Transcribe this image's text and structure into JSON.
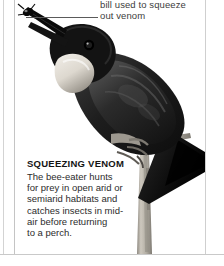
{
  "page": {
    "background_color": "#ffffff",
    "rule_color": "#c9c9c9"
  },
  "annotation": {
    "name": "bill-callout",
    "lines": [
      "bill used to squeeze",
      "out venom"
    ],
    "text": "bill used to squeeze out venom",
    "leader_line_color": "#5a5a5a"
  },
  "caption": {
    "title": "SQUEEZING VENOM",
    "lines": [
      "The bee-eater hunts",
      "for prey in open arid or",
      "semiarid habitats and",
      "catches insects in mid-",
      "air before returning",
      "to a perch."
    ],
    "text": "The bee-eater hunts for prey in open arid or semiarid habitats and catches insects in mid-air before returning to a perch."
  },
  "artwork": {
    "subject": "bee-eater bird perched on branch holding insect in bill",
    "alt": "Photograph of a dark bee-eater with pale throat patch gripping a vertical branch, an insect held in its open bill",
    "colors": {
      "plumage_dark": "#1b1b1b",
      "plumage_mid": "#4a4a4a",
      "throat_pale": "#e2ded6",
      "branch": "#b9b4aa",
      "background": "#ffffff"
    }
  }
}
